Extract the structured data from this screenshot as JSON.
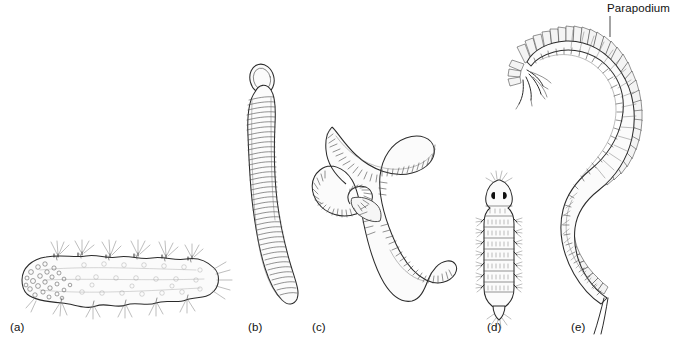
{
  "figure": {
    "background_color": "#ffffff",
    "ink_color": "#2b2b2b",
    "style": "pen-and-ink scientific line drawing"
  },
  "callouts": [
    {
      "id": "parapodium",
      "text": "Parapodium",
      "x": 607,
      "y": 10,
      "leader_from_x": 610,
      "leader_from_y": 14,
      "leader_to_x": 610,
      "leader_to_y": 36,
      "points_at_panel": "e"
    }
  ],
  "panels": [
    {
      "id": "a",
      "label": "(a)",
      "label_x": 10,
      "label_y": 330,
      "description": "dorsoventrally flattened worm with marginal setal bundles and granular anterior",
      "orientation": "horizontal",
      "has_setae": true,
      "has_eyes": false,
      "segment_count": 14
    },
    {
      "id": "b",
      "label": "(b)",
      "label_x": 248,
      "label_y": 330,
      "description": "elongate smooth-bodied worm with rounded anterior proboscis lobe and fine annulations",
      "orientation": "vertical",
      "has_setae": false,
      "has_eyes": false,
      "segment_count": 78
    },
    {
      "id": "c",
      "label": "(c)",
      "label_x": 312,
      "label_y": 330,
      "description": "S-curved earthworm-like annelid with heavy segmentation and a smooth clitellum band",
      "orientation": "curved",
      "has_setae": false,
      "has_eyes": false,
      "segment_count": 96
    },
    {
      "id": "d",
      "label": "(d)",
      "label_x": 487,
      "label_y": 330,
      "description": "small segmented larval worm with two dark eyespots, lateral setal tufts and pointed tail",
      "orientation": "vertical",
      "has_setae": true,
      "has_eyes": true,
      "segment_count": 11
    },
    {
      "id": "e",
      "label": "(e)",
      "label_x": 571,
      "label_y": 330,
      "description": "large S-curved polychaete with prominent paddle-shaped parapodia, head appendages and paired tail cirri",
      "orientation": "curved",
      "has_setae": true,
      "has_eyes": false,
      "segment_count": 62
    }
  ]
}
